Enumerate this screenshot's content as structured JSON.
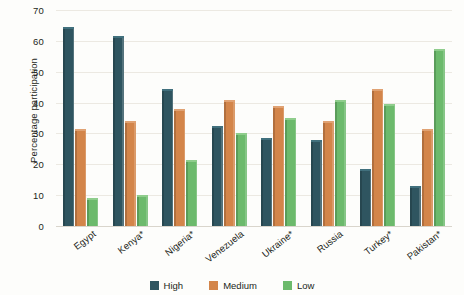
{
  "chart_data": {
    "type": "bar",
    "title": "",
    "subtitle": "",
    "xlabel": "",
    "ylabel": "Percentage participation",
    "ylim": [
      0,
      70
    ],
    "ytick_step": 10,
    "yticks": [
      70,
      60,
      50,
      40,
      30,
      20,
      10,
      0
    ],
    "grid": true,
    "legend_position": "bottom",
    "categories": [
      "Egypt",
      "Kenya*",
      "Nigeria*",
      "Venezuela",
      "Ukraine*",
      "Russia",
      "Turkey*",
      "Pakistan*"
    ],
    "series": [
      {
        "name": "High",
        "color": "#2f5560",
        "values": [
          64.5,
          61.5,
          44.5,
          32.5,
          28.5,
          28.0,
          18.5,
          13.0
        ]
      },
      {
        "name": "Medium",
        "color": "#d3854a",
        "values": [
          31.5,
          34.0,
          38.0,
          41.0,
          39.0,
          34.0,
          44.5,
          31.5
        ]
      },
      {
        "name": "Low",
        "color": "#6cba6c",
        "values": [
          9.0,
          10.0,
          21.5,
          30.0,
          35.0,
          41.0,
          39.5,
          57.5
        ]
      }
    ]
  },
  "legend": {
    "items": [
      {
        "label": "High",
        "key": "high"
      },
      {
        "label": "Medium",
        "key": "medium"
      },
      {
        "label": "Low",
        "key": "low"
      }
    ]
  },
  "colors": {
    "high": "#2f5560",
    "medium": "#d3854a",
    "low": "#6cba6c",
    "gridline": "#ece9e2",
    "text": "#231f20",
    "background": "#fdfdfb"
  }
}
